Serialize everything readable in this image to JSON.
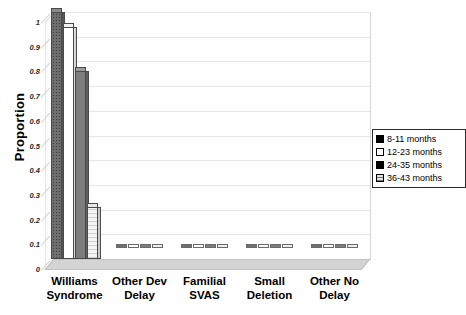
{
  "chart_data": {
    "type": "bar",
    "title": "",
    "xlabel": "",
    "ylabel": "Proportion",
    "ylim": [
      0,
      1
    ],
    "ytick_labels": [
      "1",
      "0.9",
      "0.8",
      "0.7",
      "0.6",
      "0.5",
      "0.4",
      "0.3",
      "0.2",
      "0.1",
      "0"
    ],
    "ytick_values": [
      1,
      0.9,
      0.8,
      0.7,
      0.6,
      0.5,
      0.4,
      0.3,
      0.2,
      0.1,
      0
    ],
    "grid": true,
    "legend_position": "right",
    "style": "3d-clustered-column",
    "categories": [
      "Williams Syndrome",
      "Other Dev Delay",
      "Familial SVAS",
      "Small Deletion",
      "Other No Delay"
    ],
    "category_lines": [
      [
        "Williams",
        "Syndrome"
      ],
      [
        "Other Dev",
        "Delay"
      ],
      [
        "Familial",
        "SVAS"
      ],
      [
        "Small",
        "Deletion"
      ],
      [
        "Other No",
        "Delay"
      ]
    ],
    "series": [
      {
        "name": "8-11 months",
        "values": [
          1.0,
          0,
          0,
          0,
          0
        ]
      },
      {
        "name": "12-23 months",
        "values": [
          0.94,
          0,
          0,
          0,
          0
        ]
      },
      {
        "name": "24-35 months",
        "values": [
          0.76,
          0,
          0,
          0,
          0
        ]
      },
      {
        "name": "36-43 months",
        "values": [
          0.21,
          0,
          0,
          0,
          0
        ]
      }
    ]
  },
  "legend": {
    "items": [
      {
        "label": "8-11 months"
      },
      {
        "label": "12-23 months"
      },
      {
        "label": "24-35 months"
      },
      {
        "label": "36-43 months"
      }
    ]
  },
  "axis": {
    "y_title": "Proportion"
  }
}
